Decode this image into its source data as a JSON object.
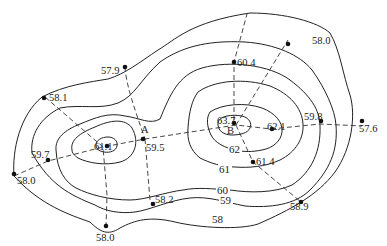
{
  "diagram": {
    "type": "contour-map",
    "contour_labels": [
      {
        "id": "c58",
        "text": "58",
        "x": 37,
        "y": 103
      },
      {
        "id": "c59",
        "text": "59",
        "x": 45,
        "y": 82
      },
      {
        "id": "c60",
        "text": "60",
        "x": 43,
        "y": 72
      },
      {
        "id": "c61",
        "text": "61",
        "x": 47,
        "y": 52
      },
      {
        "id": "c62",
        "text": "62",
        "x": 52,
        "y": 32
      }
    ],
    "points": [
      {
        "id": "p580_top",
        "value": "58.0"
      },
      {
        "id": "p579",
        "value": "57.9"
      },
      {
        "id": "p604",
        "value": "60.4"
      },
      {
        "id": "p581",
        "value": "58.1"
      },
      {
        "id": "p637",
        "value": "63.7"
      },
      {
        "id": "p621",
        "value": "62.1"
      },
      {
        "id": "p598",
        "value": "59.8"
      },
      {
        "id": "p576",
        "value": "57.6"
      },
      {
        "id": "p614",
        "value": "61.4"
      },
      {
        "id": "p595",
        "value": "59.5"
      },
      {
        "id": "p597",
        "value": "59.7"
      },
      {
        "id": "p580_left",
        "value": "58.0"
      },
      {
        "id": "p582",
        "value": "58.2"
      },
      {
        "id": "p589",
        "value": "58.9"
      },
      {
        "id": "p580_bottom",
        "value": "58.0"
      },
      {
        "id": "p611",
        "value": "61.1"
      }
    ],
    "letters": {
      "A": "A",
      "B": "B"
    },
    "contours": {
      "c58": "58",
      "c59": "59",
      "c60": "60",
      "c61": "61",
      "c62": "62"
    }
  }
}
